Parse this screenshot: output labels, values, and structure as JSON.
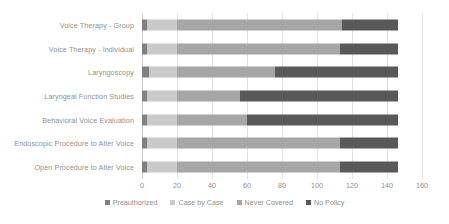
{
  "chart_data": {
    "type": "bar",
    "orientation": "horizontal",
    "stacked": true,
    "title": "",
    "xlabel": "",
    "ylabel": "",
    "xlim": [
      0,
      160
    ],
    "xticks": [
      0,
      20,
      40,
      60,
      80,
      100,
      120,
      140,
      160
    ],
    "grid": true,
    "legend_position": "bottom",
    "categories": [
      "Voice Therapy - Group",
      "Voice Therapy - Individual",
      "Laryngoscopy",
      "Laryngeal Function Studies",
      "Behavioral Voice Evaluation",
      "Endoscopic Procedure to Alter Voice",
      "Open Procedure to Alter Voice"
    ],
    "series": [
      {
        "name": "Preauthorized",
        "color": "#808080",
        "values": [
          3,
          3,
          4,
          3,
          3,
          3,
          3
        ]
      },
      {
        "name": "Case by Case",
        "color": "#c9c9c9",
        "values": [
          17,
          17,
          16,
          17,
          17,
          17,
          17
        ]
      },
      {
        "name": "Never Covered",
        "color": "#a6a6a6",
        "values": [
          94,
          93,
          56,
          36,
          40,
          93,
          93
        ]
      },
      {
        "name": "No Policy",
        "color": "#595959",
        "values": [
          32,
          33,
          70,
          90,
          86,
          33,
          33
        ]
      }
    ],
    "totals": [
      146,
      146,
      146,
      146,
      146,
      146,
      146
    ]
  },
  "legend": {
    "items": [
      {
        "label": "Preauthorized",
        "color": "#808080"
      },
      {
        "label": "Case by Case",
        "color": "#c9c9c9"
      },
      {
        "label": "Never Covered",
        "color": "#a6a6a6"
      },
      {
        "label": "No Policy",
        "color": "#595959"
      }
    ]
  },
  "axis": {
    "tick_labels": [
      "0",
      "20",
      "40",
      "60",
      "80",
      "100",
      "120",
      "140",
      "160"
    ]
  }
}
